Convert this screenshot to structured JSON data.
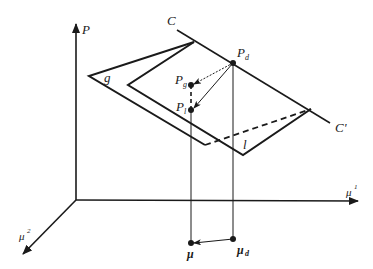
{
  "diagram": {
    "axes": {
      "vertical_label": "P",
      "horizontal_label": "μ",
      "horizontal_sup": "1",
      "depth_label": "μ",
      "depth_sup": "2"
    },
    "line": {
      "start_label": "C",
      "end_label": "C'"
    },
    "planes": {
      "outer_label": "g",
      "inner_label": "l"
    },
    "points": {
      "pd_main": "P",
      "pd_sub": "d",
      "pg_main": "P",
      "pg_sub": "g",
      "pl_main": "P",
      "pl_sub": "l",
      "mu_label": "μ",
      "mud_main": "μ",
      "mud_sub": "d"
    },
    "colors": {
      "stroke": "#1a1a1a",
      "background": "#ffffff"
    }
  }
}
